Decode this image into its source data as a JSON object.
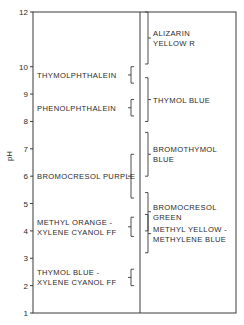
{
  "chart_data": {
    "type": "range-diagram",
    "title": "",
    "ylabel": "pH",
    "xlabel": "",
    "ylim": [
      1,
      12
    ],
    "y_ticks": [
      1,
      2,
      3,
      4,
      5,
      6,
      7,
      8,
      9,
      10,
      12
    ],
    "grid": false,
    "legend": null,
    "left_column": [
      {
        "name": "THYMOLPHTHALEIN",
        "lines": [
          "THYMOLPHTHALEIN"
        ],
        "range": [
          9.4,
          10.0
        ]
      },
      {
        "name": "PHENOLPHTHALEIN",
        "lines": [
          "PHENOLPHTHALEIN"
        ],
        "range": [
          8.2,
          8.8
        ]
      },
      {
        "name": "BROMOCRESOL PURPLE",
        "lines": [
          "BROMOCRESOL PURPLE"
        ],
        "range": [
          5.2,
          6.8
        ]
      },
      {
        "name": "METHYL ORANGE - XYLENE CYANOL FF",
        "lines": [
          "METHYL ORANGE -",
          "XYLENE CYANOL FF"
        ],
        "range": [
          3.8,
          4.5
        ]
      },
      {
        "name": "THYMOL BLUE - XYLENE CYANOL FF",
        "lines": [
          "THYMOL BLUE -",
          "XYLENE CYANOL FF"
        ],
        "range": [
          2.0,
          2.6
        ]
      }
    ],
    "right_column": [
      {
        "name": "ALIZARIN YELLOW R",
        "lines": [
          "ALIZARIN",
          "YELLOW R"
        ],
        "range": [
          10.1,
          12.0
        ]
      },
      {
        "name": "THYMOL BLUE",
        "lines": [
          "THYMOL BLUE"
        ],
        "range": [
          8.0,
          9.6
        ]
      },
      {
        "name": "BROMOTHYMOL BLUE",
        "lines": [
          "BROMOTHYMOL",
          "BLUE"
        ],
        "range": [
          6.0,
          7.6
        ]
      },
      {
        "name": "BROMOCRESOL GREEN",
        "lines": [
          "BROMOCRESOL",
          "GREEN"
        ],
        "range": [
          4.0,
          5.4
        ]
      },
      {
        "name": "METHYL YELLOW - METHYLENE BLUE",
        "lines": [
          "METHYL YELLOW -",
          "METHYLENE BLUE"
        ],
        "range": [
          3.2,
          4.6
        ]
      }
    ]
  },
  "layout": {
    "plot": {
      "left": 33,
      "right": 236,
      "top": 12,
      "bottom": 313,
      "divider_x": 140
    },
    "y_px_per_unit": 27.4
  }
}
